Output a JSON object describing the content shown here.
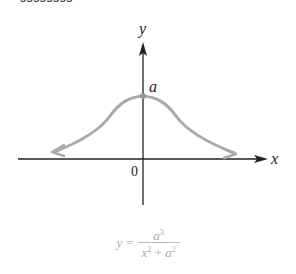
{
  "top_fragment": "ssssssss",
  "diagram": {
    "axis_labels": {
      "x": "x",
      "y": "y"
    },
    "origin_label": "0",
    "peak_label": "a",
    "curve_name": "Witch of Agnesi",
    "colors": {
      "axis": "#222222",
      "curve": "#aaaaaa"
    }
  },
  "equation": {
    "lhs": "y",
    "equals": "=",
    "numerator_base": "a",
    "numerator_exp": "3",
    "denominator_x": "x",
    "denominator_x_exp": "2",
    "plus": "+",
    "denominator_a": "a",
    "denominator_a_exp": "2"
  }
}
